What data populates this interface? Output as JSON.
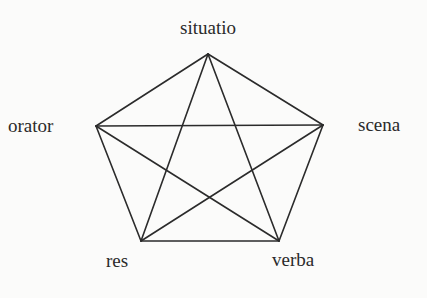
{
  "diagram": {
    "type": "complete-graph-pentagon",
    "nodes": [
      {
        "id": "situatio",
        "label": "situatio",
        "x": 208,
        "y": 54,
        "label_x": 208,
        "label_y": 34,
        "anchor": "middle"
      },
      {
        "id": "orator",
        "label": "orator",
        "x": 96,
        "y": 126,
        "label_x": 8,
        "label_y": 132,
        "anchor": "start"
      },
      {
        "id": "scena",
        "label": "scena",
        "x": 323,
        "y": 125,
        "label_x": 358,
        "label_y": 131,
        "anchor": "start"
      },
      {
        "id": "res",
        "label": "res",
        "x": 141,
        "y": 241,
        "label_x": 106,
        "label_y": 267,
        "anchor": "start"
      },
      {
        "id": "verba",
        "label": "verba",
        "x": 279,
        "y": 241,
        "label_x": 272,
        "label_y": 266,
        "anchor": "start"
      }
    ],
    "edges": [
      [
        "situatio",
        "orator"
      ],
      [
        "situatio",
        "scena"
      ],
      [
        "situatio",
        "res"
      ],
      [
        "situatio",
        "verba"
      ],
      [
        "orator",
        "scena"
      ],
      [
        "orator",
        "res"
      ],
      [
        "orator",
        "verba"
      ],
      [
        "scena",
        "res"
      ],
      [
        "scena",
        "verba"
      ],
      [
        "res",
        "verba"
      ]
    ],
    "colors": {
      "line": "#2b2b2b",
      "text": "#2a2a2a",
      "background": "#fbfbfa"
    }
  }
}
